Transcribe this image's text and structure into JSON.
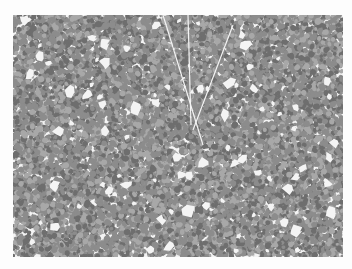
{
  "image": {
    "subject": "grayscale histology micrograph of densely packed cells",
    "background_color": "#fdfdfd",
    "region": {
      "x": 13,
      "y": 15,
      "width": 330,
      "height": 242
    },
    "palette": {
      "cell_dark": "#6e6e6e",
      "cell_mid": "#8c8c8c",
      "cell_light": "#a8a8a8",
      "gap": "#f4f4f4"
    },
    "texture": {
      "seed": 7,
      "cell_density": 0.0625,
      "cell_radius_min": 1.6,
      "cell_radius_max": 3.2,
      "gap_count": 90,
      "gap_radius_min": 2,
      "gap_radius_max": 6,
      "streaks": [
        {
          "x1": 150,
          "y1": 0,
          "x2": 190,
          "y2": 130
        },
        {
          "x1": 175,
          "y1": 0,
          "x2": 178,
          "y2": 110
        },
        {
          "x1": 220,
          "y1": 10,
          "x2": 180,
          "y2": 115
        }
      ]
    }
  }
}
